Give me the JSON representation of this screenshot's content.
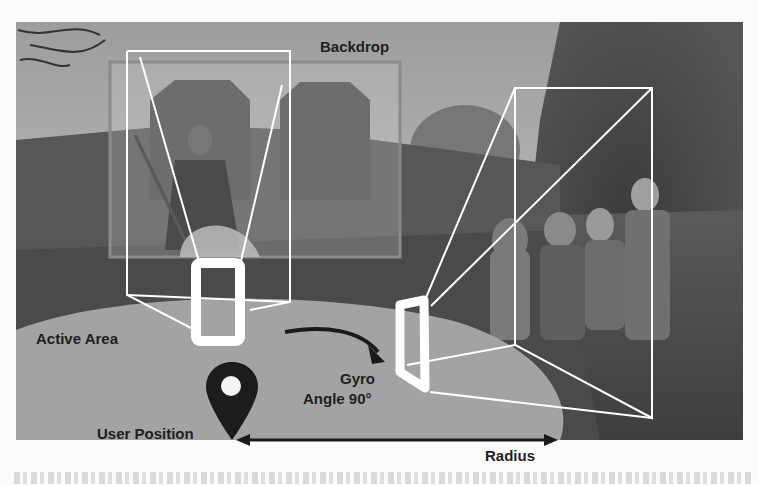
{
  "figure": {
    "labels": {
      "backdrop": "Backdrop",
      "active_area": "Active Area",
      "gyro_line1": "Gyro",
      "gyro_line2": "Angle 90°",
      "user_position": "User Position",
      "radius": "Radius"
    },
    "icons": {
      "location_pin": "map-pin-icon",
      "rotation_arrow": "curved-arrow-icon",
      "radius_arrow": "double-arrow-icon"
    },
    "colors": {
      "photo_dark": "#3a3a3a",
      "photo_mid": "#6b6b6b",
      "sky": "#a8a8a8",
      "active_area": "#a2a2a2",
      "frame_lines": "#ffffff",
      "backdrop_border": "#8a8a8a",
      "text": "#1f1f1f",
      "pin": "#1c1c1c"
    }
  }
}
